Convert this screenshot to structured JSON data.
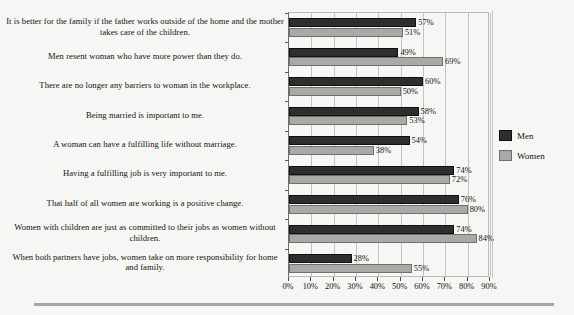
{
  "chart_data": {
    "type": "bar",
    "orientation": "horizontal",
    "title": "",
    "xlabel": "",
    "ylabel": "",
    "xlim": [
      0,
      90
    ],
    "xticks": [
      "0%",
      "10%",
      "20%",
      "30%",
      "40%",
      "50%",
      "60%",
      "70%",
      "80%",
      "90%"
    ],
    "xtick_values": [
      0,
      10,
      20,
      30,
      40,
      50,
      60,
      70,
      80,
      90
    ],
    "grid": true,
    "grid_axis": "x",
    "legend_position": "right",
    "categories": [
      "It is better for the family if the father works outside of the home and the mother takes care of the children.",
      "Men resent woman who have more power than they do.",
      "There are no longer any barriers to woman in the workplace.",
      "Being married is important to me.",
      "A woman can have a fulfilling life without marriage.",
      "Having a fulfilling job is very important to me.",
      "That half of all women are working is a positive change.",
      "Women with children are just as committed to their jobs as women without children.",
      "When both partners have jobs, women take on more responsibility for home and family."
    ],
    "series": [
      {
        "name": "Men",
        "color": "#2e2e2e",
        "values": [
          57,
          49,
          60,
          58,
          54,
          74,
          76,
          74,
          28
        ],
        "labels": [
          "57%",
          "49%",
          "60%",
          "58%",
          "54%",
          "74%",
          "76%",
          "74%",
          "28%"
        ]
      },
      {
        "name": "Women",
        "color": "#a9a9a6",
        "values": [
          51,
          69,
          50,
          53,
          38,
          72,
          80,
          84,
          55
        ],
        "labels": [
          "51%",
          "69%",
          "50%",
          "53%",
          "38%",
          "72%",
          "80%",
          "84%",
          "55%"
        ]
      }
    ]
  },
  "legend": {
    "items": [
      {
        "label": "Men",
        "color": "#2e2e2e"
      },
      {
        "label": "Women",
        "color": "#a9a9a6"
      }
    ]
  }
}
